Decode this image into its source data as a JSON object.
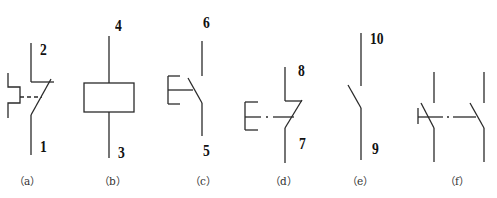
{
  "figure": {
    "type": "electrical symbol diagram",
    "line_color": "#2a2a2a",
    "background": "#ffffff"
  },
  "symbols": [
    {
      "id": "a",
      "caption": "（a）",
      "description": "pushbutton-operated changeover contact",
      "top_terminal": "2",
      "bottom_terminal": "1"
    },
    {
      "id": "b",
      "caption": "（b）",
      "description": "relay coil",
      "top_terminal": "4",
      "bottom_terminal": "3"
    },
    {
      "id": "c",
      "caption": "（c）",
      "description": "pushbutton normally-open contact",
      "top_terminal": "6",
      "bottom_terminal": "5"
    },
    {
      "id": "d",
      "caption": "（d）",
      "description": "pushbutton normally-closed contact",
      "top_terminal": "8",
      "bottom_terminal": "7"
    },
    {
      "id": "e",
      "caption": "（e）",
      "description": "normally-open contact",
      "top_terminal": "10",
      "bottom_terminal": "9"
    },
    {
      "id": "f",
      "caption": "（f）",
      "description": "ganged normally-open contacts",
      "top_terminal": "",
      "bottom_terminal": ""
    }
  ]
}
